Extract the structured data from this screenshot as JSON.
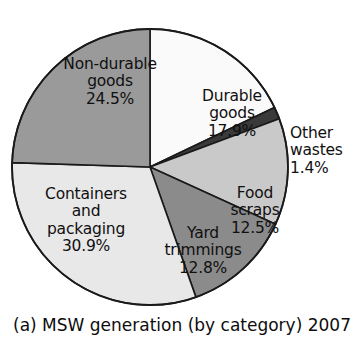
{
  "caption": "(a) MSW generation (by category) 2007",
  "chart_data": {
    "type": "pie",
    "title": "(a) MSW generation (by category) 2007",
    "xlabel": "",
    "ylabel": "",
    "units": "percent",
    "legend_position": "none",
    "grid": false,
    "start_angle_deg": 0,
    "direction": "clockwise",
    "categories": [
      "Durable goods",
      "Other wastes",
      "Food scraps",
      "Yard trimmings",
      "Containers and packaging",
      "Non-durable goods"
    ],
    "values": [
      17.9,
      1.4,
      12.5,
      12.8,
      30.9,
      24.5
    ],
    "total": 100.0,
    "slices": [
      {
        "key": "durable",
        "label_lines": [
          "Durable",
          "goods",
          "17.9%"
        ],
        "name": "Durable goods",
        "value": 17.9,
        "value_text": "17.9%",
        "color": "#fafafa",
        "label_placement": "inside"
      },
      {
        "key": "other_wastes",
        "label_lines": [
          "Other",
          "wastes",
          "1.4%"
        ],
        "name": "Other wastes",
        "value": 1.4,
        "value_text": "1.4%",
        "color": "#3a3a3a",
        "label_placement": "outside"
      },
      {
        "key": "food_scraps",
        "label_lines": [
          "Food",
          "scraps",
          "12.5%"
        ],
        "name": "Food scraps",
        "value": 12.5,
        "value_text": "12.5%",
        "color": "#c9c9c9",
        "label_placement": "inside"
      },
      {
        "key": "yard_trimmings",
        "label_lines": [
          "Yard",
          "trimmings",
          "12.8%"
        ],
        "name": "Yard trimmings",
        "value": 12.8,
        "value_text": "12.8%",
        "color": "#8b8b8b",
        "label_placement": "inside"
      },
      {
        "key": "containers_packaging",
        "label_lines": [
          "Containers",
          "and",
          "packaging",
          "30.9%"
        ],
        "name": "Containers and packaging",
        "value": 30.9,
        "value_text": "30.9%",
        "color": "#e8e8e8",
        "label_placement": "inside"
      },
      {
        "key": "non_durable",
        "label_lines": [
          "Non-durable",
          "goods",
          "24.5%"
        ],
        "name": "Non-durable goods",
        "value": 24.5,
        "value_text": "24.5%",
        "color": "#9a9a9a",
        "label_placement": "inside"
      }
    ],
    "geometry": {
      "center_x": 150,
      "center_y": 167,
      "radius": 138
    },
    "stroke_color": "#1a1a1a",
    "background_color": "#ffffff"
  }
}
